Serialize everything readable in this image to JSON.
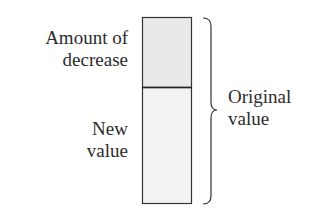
{
  "diagram": {
    "type": "percent-decrease bar diagram",
    "labels": {
      "decrease": [
        "Amount of",
        "decrease"
      ],
      "new_value": [
        "New",
        "value"
      ],
      "original_value": [
        "Original",
        "value"
      ]
    },
    "bar": {
      "top_segment": "Amount of decrease",
      "bottom_segment": "New value",
      "brace_spans": "Original value"
    },
    "colors": {
      "top_fill": "#e9e9e9",
      "bottom_fill": "#f3f3f3",
      "stroke": "#333333",
      "text": "#2b2b2b"
    }
  }
}
